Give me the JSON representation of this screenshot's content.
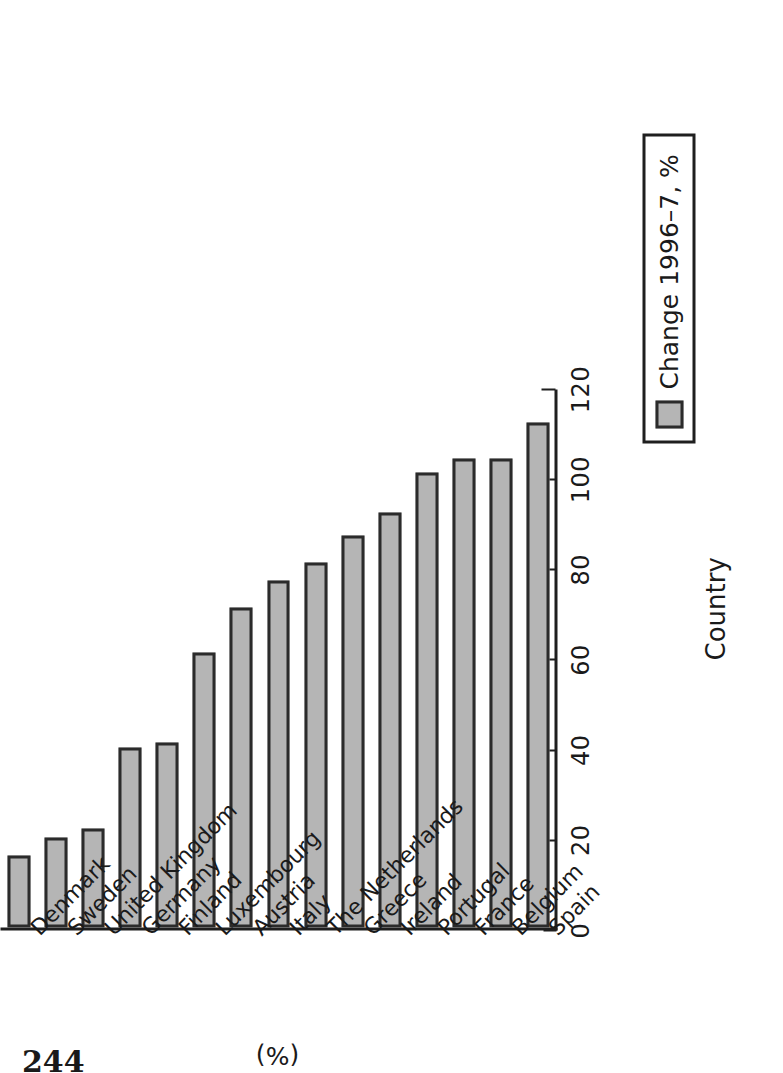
{
  "page": {
    "folio": "244"
  },
  "chart_data": {
    "type": "bar",
    "orientation": "vertical-printed-rotated",
    "title": "",
    "xlabel": "Country",
    "ylabel": "(%)",
    "ylim": [
      0,
      120
    ],
    "yticks": [
      0,
      20,
      40,
      60,
      80,
      100,
      120
    ],
    "ytick_labels": [
      "0",
      "20",
      "40",
      "60",
      "80",
      "100",
      "120"
    ],
    "grid": false,
    "legend_position": "bottom-right",
    "legend": [
      "Change 1996–7, %"
    ],
    "series_name": "Change 1996–7, %",
    "categories": [
      "Denmark",
      "Sweden",
      "United Kingdom",
      "Germany",
      "Finland",
      "Luxembourg",
      "Austria",
      "Italy",
      "The Netherlands",
      "Greece",
      "Ireland",
      "Portugal",
      "France",
      "Belgium",
      "Spain"
    ],
    "values": [
      16,
      20,
      22,
      40,
      41,
      61,
      71,
      77,
      81,
      87,
      92,
      101,
      104,
      104,
      112
    ],
    "bar_fill": "#b5b5b5",
    "bar_edge": "#2b2b2b"
  },
  "axis": {
    "value_axis_label": "(%)",
    "category_axis_label": "Country"
  },
  "legend": {
    "label": "Change 1996–7, %",
    "swatch_color": "#b5b5b5",
    "swatch_border": "#2b2b2b"
  }
}
